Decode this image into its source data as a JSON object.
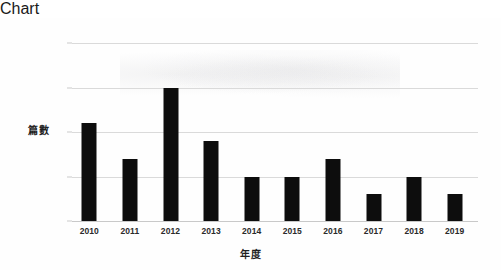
{
  "chart_data": {
    "type": "bar",
    "title": "",
    "subtitle": "",
    "categories": [
      "2010",
      "2011",
      "2012",
      "2013",
      "2014",
      "2015",
      "2016",
      "2017",
      "2018",
      "2019"
    ],
    "values": [
      11,
      7,
      15,
      9,
      5,
      5,
      7,
      3,
      5,
      3
    ],
    "xlabel": "年度",
    "ylabel": "篇數",
    "ylim": [
      0,
      20
    ],
    "y_ticks": [
      0,
      5,
      10,
      15,
      20
    ],
    "y_tick_labels": [
      "0",
      "5",
      "10",
      "15",
      "20"
    ],
    "grid": "horizontal",
    "legend": "none",
    "bar_color": "#0d0d0d",
    "gridline_color": "#dadada",
    "background_color": "#ffffff"
  }
}
